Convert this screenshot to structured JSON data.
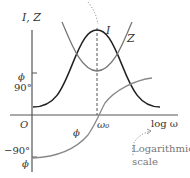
{
  "diagram": {
    "axis_y_label": "I, Z",
    "axis_x_label": "log ω",
    "origin_label": "O",
    "tick_phi_top": "ϕ",
    "tick_90": "90°",
    "tick_neg90": "−90°",
    "tick_phi_bottom": "ϕ",
    "curve_I_label": "I",
    "curve_Z_label": "Z",
    "curve_phi_label": "ϕ",
    "omega0_label": "ω₀",
    "annotation_line1": "Logarithmic",
    "annotation_line2": "scale",
    "colors": {
      "axis": "#555555",
      "curve_I": "#222222",
      "curve_Z": "#777777",
      "curve_phi": "#888888",
      "annotation": "#777777"
    }
  }
}
